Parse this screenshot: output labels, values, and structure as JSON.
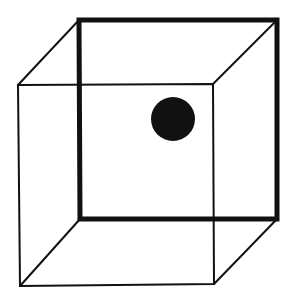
{
  "figure": {
    "type": "necker-cube-illusion",
    "colors": {
      "background": "#ffffff",
      "stroke": "#111111",
      "dot": "#111111"
    },
    "bold_face": {
      "corners": [
        [
          79,
          20
        ],
        [
          277,
          20
        ],
        [
          277,
          219
        ],
        [
          80,
          219
        ]
      ],
      "stroke_width": 5
    },
    "thin_face": {
      "corners": [
        [
          18,
          85
        ],
        [
          213,
          84
        ],
        [
          214,
          284
        ],
        [
          20,
          286
        ]
      ],
      "stroke_width": 2
    },
    "connecting_edges": [
      [
        [
          18,
          85
        ],
        [
          79,
          20
        ]
      ],
      [
        [
          213,
          84
        ],
        [
          277,
          20
        ]
      ],
      [
        [
          214,
          284
        ],
        [
          277,
          219
        ]
      ],
      [
        [
          20,
          286
        ],
        [
          80,
          219
        ]
      ]
    ],
    "dot": {
      "cx": 173,
      "cy": 119,
      "r": 22
    }
  }
}
